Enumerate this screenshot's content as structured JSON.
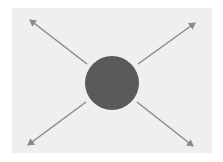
{
  "diagram": {
    "type": "radial-expansion",
    "background_color": "#efefef",
    "center_node": {
      "shape": "circle",
      "cx": 112,
      "cy": 83,
      "r": 27,
      "color": "#5a5a5a"
    },
    "arrow_color": "#8a8a8a",
    "arrows": [
      {
        "direction": "up-left",
        "x1": 87,
        "y1": 64,
        "x2": 30,
        "y2": 20
      },
      {
        "direction": "up-right",
        "x1": 138,
        "y1": 64,
        "x2": 195,
        "y2": 23
      },
      {
        "direction": "down-left",
        "x1": 86,
        "y1": 102,
        "x2": 28,
        "y2": 145
      },
      {
        "direction": "down-right",
        "x1": 137,
        "y1": 102,
        "x2": 193,
        "y2": 146
      }
    ]
  }
}
